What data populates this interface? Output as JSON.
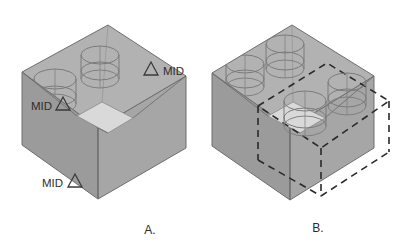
{
  "document": {
    "type": "cad-wireframe-illustration",
    "background_color": "#ffffff",
    "description": "Two shaded isometric box solids with wireframe cylinders and MID snap markers"
  },
  "palette": {
    "top_face": "#b2b2b2",
    "left_face": "#9b9b9b",
    "right_face": "#a6a6a6",
    "inner_floor": "#d9d9d9",
    "inner_wall": "#b8b8b8",
    "edge_stroke": "#6e6e6e",
    "dashed_stroke": "#2a2a2a",
    "cylinder_stroke": "#7b7b7b",
    "marker_stroke": "#3a3a3a",
    "text_color": "#2e2e2e"
  },
  "figures": [
    {
      "id": "figure-a",
      "caption": "A.",
      "cylinder_count": 2,
      "has_dashed_cube": false,
      "markers": [
        {
          "id": "mid-marker-top-right",
          "label": "MID",
          "glyph": "triangle",
          "label_side": "right",
          "x": 151,
          "y": 69
        },
        {
          "id": "mid-marker-mid-left",
          "label": "MID",
          "glyph": "triangle",
          "label_side": "left",
          "x": 62,
          "y": 104
        },
        {
          "id": "mid-marker-bottom-left",
          "label": "MID",
          "glyph": "triangle",
          "label_side": "left",
          "x": 73,
          "y": 181
        }
      ]
    },
    {
      "id": "figure-b",
      "caption": "B.",
      "cylinder_count": 4,
      "has_dashed_cube": true,
      "markers": []
    }
  ],
  "captions": {
    "figure_a": "A.",
    "figure_b": "B."
  },
  "marker_labels": {
    "mid": "MID"
  }
}
